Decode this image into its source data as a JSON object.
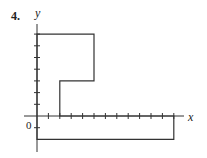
{
  "problem_number": "4.",
  "axes": {
    "x_label": "x",
    "y_label": "y",
    "origin_label": "0"
  },
  "x_ticks": [
    1,
    2,
    3,
    4,
    5,
    6,
    7,
    8,
    9,
    10,
    11,
    12
  ],
  "y_ticks": [
    -1,
    1,
    2,
    3,
    4,
    5,
    6,
    7
  ],
  "polygon": [
    [
      0,
      7
    ],
    [
      5,
      7
    ],
    [
      5,
      3
    ],
    [
      2,
      3
    ],
    [
      2,
      0
    ],
    [
      12,
      0
    ],
    [
      12,
      -2
    ],
    [
      0,
      -2
    ]
  ]
}
